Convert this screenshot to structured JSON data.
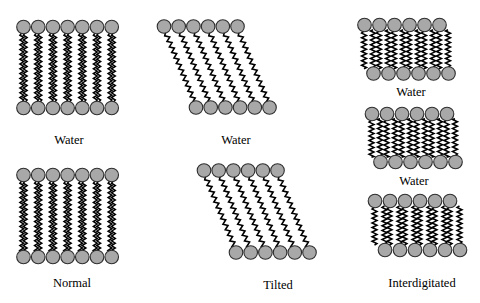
{
  "colors": {
    "background": "#ffffff",
    "head_fill": "#a8a8a8",
    "head_stroke": "#2e2e2e",
    "tail": "#000000",
    "text": "#000000"
  },
  "panels": [
    {
      "id": "normal-top",
      "type": "normal",
      "label": "Water",
      "head_count": 7,
      "top": {
        "x0": 23.5,
        "y": 27,
        "spacing": 14.7
      },
      "bottom": {
        "x0": 23.5,
        "y": 108,
        "spacing": 14.7
      }
    },
    {
      "id": "tilted-top",
      "type": "tilted",
      "label": "Water",
      "head_count": 6,
      "top": {
        "x0": 164,
        "y": 26.5,
        "spacing": 14.7
      },
      "bottom": {
        "x0": 196,
        "y": 107.5,
        "spacing": 14.7
      }
    },
    {
      "id": "interdigitated-1",
      "type": "interdigitated",
      "label": "Water",
      "head_count": 6,
      "top": {
        "x0": 364.5,
        "y": 25,
        "spacing": 15
      },
      "bottom": {
        "x0": 373.5,
        "y": 73.5,
        "spacing": 15
      }
    },
    {
      "id": "interdigitated-2",
      "type": "interdigitated",
      "label": "Water",
      "head_count": 6,
      "top": {
        "x0": 372,
        "y": 114,
        "spacing": 15
      },
      "bottom": {
        "x0": 380.5,
        "y": 162,
        "spacing": 15
      }
    },
    {
      "id": "interdigitated-3",
      "type": "interdigitated",
      "label": "Interdigitated",
      "head_count": 6,
      "top": {
        "x0": 375,
        "y": 201,
        "spacing": 15
      },
      "bottom": {
        "x0": 385,
        "y": 250,
        "spacing": 15
      }
    },
    {
      "id": "normal-bottom",
      "type": "normal",
      "label": "Normal",
      "head_count": 7,
      "top": {
        "x0": 23.5,
        "y": 175,
        "spacing": 14.7
      },
      "bottom": {
        "x0": 23.5,
        "y": 257,
        "spacing": 14.7
      }
    },
    {
      "id": "tilted-bottom",
      "type": "tilted",
      "label": "Tilted",
      "head_count": 6,
      "top": {
        "x0": 204,
        "y": 170.5,
        "spacing": 14.7
      },
      "bottom": {
        "x0": 236,
        "y": 252.5,
        "spacing": 14.7
      }
    }
  ],
  "head_radius": 6.8
}
